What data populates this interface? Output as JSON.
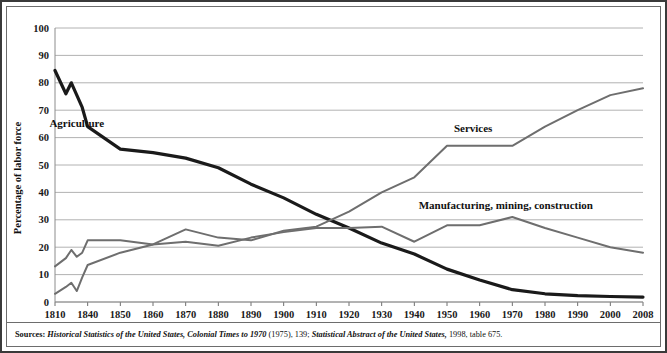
{
  "chart_data": {
    "type": "line",
    "title": "",
    "xlabel": "",
    "ylabel": "Percentage of labor force",
    "ylim": [
      0,
      100
    ],
    "ytick_step": 10,
    "ytick_labels": [
      "0",
      "10",
      "20",
      "30",
      "40",
      "50",
      "60",
      "70",
      "80",
      "90",
      "100"
    ],
    "grid": true,
    "legend_position": "inline-annotations",
    "x": [
      1810,
      1820,
      1825,
      1830,
      1835,
      1840,
      1850,
      1860,
      1870,
      1880,
      1890,
      1900,
      1910,
      1920,
      1930,
      1940,
      1950,
      1960,
      1970,
      1980,
      1990,
      2000,
      2008
    ],
    "xtick_labels": [
      "1810",
      "1840",
      "1850",
      "1860",
      "1870",
      "1880",
      "1890",
      "1900",
      "1910",
      "1920",
      "1930",
      "1940",
      "1950",
      "1960",
      "1970",
      "1980",
      "1990",
      "2000",
      "2008"
    ],
    "series": [
      {
        "name": "Agriculture",
        "color": "#1a1a1a",
        "label_x": 1830,
        "label_y": 64,
        "values": [
          84.5,
          76.0,
          80.0,
          75.5,
          71.0,
          64.0,
          55.8,
          54.5,
          52.5,
          49.0,
          43.0,
          38.0,
          32.0,
          27.0,
          21.5,
          17.5,
          12.0,
          8.0,
          4.5,
          3.0,
          2.3,
          2.0,
          1.8
        ]
      },
      {
        "name": "Manufacturing, mining, construction",
        "color": "#6e6e6e",
        "label_x": 1968,
        "label_y": 34,
        "values": [
          3.0,
          5.5,
          7.0,
          4.0,
          9.0,
          13.5,
          18.0,
          21.0,
          22.0,
          20.5,
          23.5,
          25.5,
          27.0,
          27.0,
          27.5,
          22.0,
          28.0,
          28.0,
          31.0,
          27.0,
          23.5,
          20.0,
          18.0
        ]
      },
      {
        "name": "Services",
        "color": "#6e6e6e",
        "label_x": 1958,
        "label_y": 62,
        "values": [
          13.0,
          16.0,
          19.0,
          16.5,
          18.0,
          22.5,
          22.5,
          21.0,
          26.5,
          23.5,
          22.5,
          26.0,
          27.5,
          33.0,
          40.0,
          45.5,
          57.0,
          57.0,
          57.0,
          64.0,
          70.0,
          75.5,
          78.0
        ]
      }
    ]
  },
  "annotations": {
    "agriculture_label": "Agriculture",
    "services_label": "Services",
    "manufacturing_label": "Manufacturing, mining, construction"
  },
  "source": {
    "lead": "Sources:",
    "part1": "Historical Statistics of the United States, Colonial Times to 1970",
    "part2": " (1975), 139; ",
    "part3": "Statistical Abstract of the United States,",
    "part4": " 1998, table 675."
  }
}
